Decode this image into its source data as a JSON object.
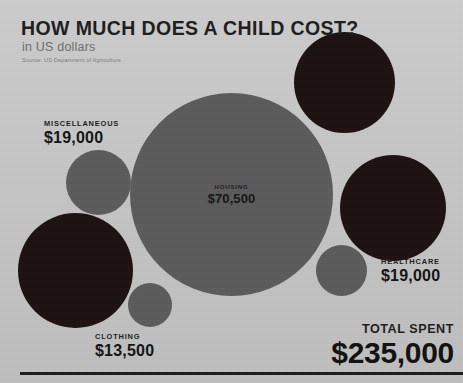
{
  "header": {
    "title": "HOW MUCH DOES A CHILD COST?",
    "subtitle": "in US dollars",
    "source": "Source: US Department of Agriculture"
  },
  "total": {
    "label": "TOTAL SPENT",
    "value": "$235,000"
  },
  "colors": {
    "background": "#c8c8c8",
    "bubble_gray": "#5b5b5b",
    "bubble_dark": "#1c1110",
    "text_dark": "#1b1b1b",
    "subtitle_gray": "#6d6d6d",
    "rule": "#1b1b1b"
  },
  "chart_data": {
    "type": "bubble",
    "title": "HOW MUCH DOES A CHILD COST?",
    "subtitle": "in US dollars",
    "source": "Source: US Department of Agriculture",
    "unit": "USD",
    "total": 235000,
    "total_label": "TOTAL SPENT",
    "total_display": "$235,000",
    "legend": "none",
    "grid": false,
    "categories": [
      "HOUSING",
      "MISCELLANEOUS",
      "CLOTHING",
      "HEALTHCARE",
      "EDUCATION",
      "TRANSPORTATION",
      "FOOD"
    ],
    "values": [
      70500,
      19000,
      13500,
      19000,
      0,
      0,
      0
    ],
    "bubbles": [
      {
        "id": "housing",
        "category": "HOUSING",
        "value_display": "$70,500",
        "value": 70500,
        "fill": "#5b5b5b",
        "label_position": "inside",
        "cx": 231,
        "cy": 194,
        "r": 101
      },
      {
        "id": "miscellaneous",
        "category": "MISCELLANEOUS",
        "value_display": "$19,000",
        "value": 19000,
        "fill": "#5b5b5b",
        "label_position": "outside-above",
        "cx": 98,
        "cy": 182,
        "r": 32
      },
      {
        "id": "clothing",
        "category": "CLOTHING",
        "value_display": "$13,500",
        "value": 13500,
        "fill": "#5b5b5b",
        "label_position": "outside-below",
        "cx": 150,
        "cy": 305,
        "r": 22
      },
      {
        "id": "healthcare",
        "category": "HEALTHCARE",
        "value_display": "$19,000",
        "value": 19000,
        "fill": "#5b5b5b",
        "label_position": "outside-right",
        "cx": 341,
        "cy": 270,
        "r": 25
      },
      {
        "id": "education",
        "category": "",
        "value_display": "",
        "fill": "#1c1110",
        "label_position": "inside-obscured",
        "cx": 345,
        "cy": 83,
        "r": 50
      },
      {
        "id": "transportation",
        "category": "",
        "value_display": "",
        "fill": "#1c1110",
        "label_position": "inside-obscured",
        "cx": 393,
        "cy": 208,
        "r": 53
      },
      {
        "id": "food",
        "category": "",
        "value_display": "",
        "fill": "#1c1110",
        "label_position": "inside-obscured",
        "cx": 75,
        "cy": 270,
        "r": 57
      }
    ]
  },
  "bubble_labels": {
    "housing_cat": "HOUSING",
    "housing_val": "$70,500",
    "misc_cat": "MISCELLANEOUS",
    "misc_val": "$19,000",
    "clothing_cat": "CLOTHING",
    "clothing_val": "$13,500",
    "healthcare_cat": "HEALTHCARE",
    "healthcare_val": "$19,000"
  }
}
